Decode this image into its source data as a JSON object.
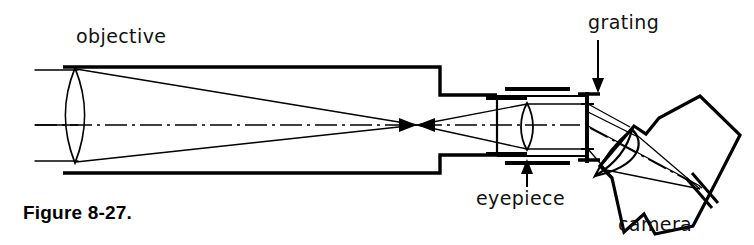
{
  "figure": {
    "caption": "Figure 8-27.",
    "background_color": "#ffffff",
    "ink_color": "#000000"
  },
  "labels": {
    "objective": "objective",
    "grating": "grating",
    "eyepiece": "eyepiece",
    "camera": "camera"
  },
  "components": [
    {
      "name": "objective-lens",
      "label": "objective",
      "kind": "biconvex-lens",
      "x": 75,
      "y_top": 68,
      "y_bottom": 163
    },
    {
      "name": "telescope-tube",
      "kind": "stepped-tube",
      "x_start": 63,
      "x_step": 440,
      "x_end": 497,
      "wide_y_top": 67,
      "wide_y_bottom": 173,
      "narrow_y_top": 95,
      "narrow_y_bottom": 155
    },
    {
      "name": "focal-point",
      "kind": "crossover",
      "x": 417,
      "y": 125
    },
    {
      "name": "eyepiece-lens",
      "label": "eyepiece",
      "kind": "biconvex-lens",
      "x": 527,
      "y_top": 103,
      "y_bottom": 150
    },
    {
      "name": "collimator-housing",
      "kind": "rectangular-box",
      "x_start": 497,
      "x_end": 587,
      "y_top": 96,
      "y_bottom": 156
    },
    {
      "name": "grating",
      "label": "grating",
      "kind": "vertical-line-element",
      "x": 587,
      "y_top": 92,
      "y_bottom": 163
    },
    {
      "name": "camera",
      "label": "camera",
      "kind": "tilted-box-with-lens",
      "center_x": 672,
      "center_y": 155,
      "tilt_degrees": -38
    }
  ],
  "arrows": [
    {
      "name": "grating-pointer",
      "from_x": 598,
      "from_y": 40,
      "to_x": 598,
      "to_y": 92,
      "direction": "down"
    },
    {
      "name": "eyepiece-pointer",
      "from_x": 527,
      "from_y": 186,
      "to_x": 527,
      "to_y": 158,
      "direction": "up"
    }
  ],
  "optical_axis": {
    "name": "optical-axis",
    "style": "dash-dot",
    "y": 125,
    "x_start": 35,
    "x_end": 580
  },
  "ray_bundles": [
    {
      "name": "incoming-parallel-rays",
      "description": "parallel beam entering objective"
    },
    {
      "name": "converging-cone",
      "description": "objective to focal point"
    },
    {
      "name": "diverging-cone",
      "description": "focal point to eyepiece"
    },
    {
      "name": "collimated-beam",
      "description": "eyepiece to grating"
    },
    {
      "name": "diffracted-beam",
      "description": "grating to camera lens"
    },
    {
      "name": "camera-cone",
      "description": "camera lens to detector plane"
    }
  ]
}
